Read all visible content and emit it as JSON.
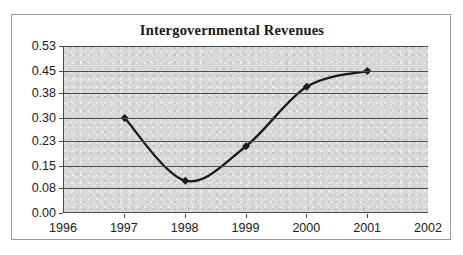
{
  "chart_data": {
    "type": "line",
    "title": "Intergovernmental Revenues",
    "xlabel": "",
    "ylabel": "",
    "x": [
      1996,
      1997,
      1998,
      1999,
      2000,
      2001,
      2002
    ],
    "xtick_labels": [
      "1996",
      "1997",
      "1998",
      "1999",
      "2000",
      "2001",
      "2002"
    ],
    "xlim": [
      1996,
      2002
    ],
    "ylim": [
      0.0,
      0.53
    ],
    "ytick_values": [
      0.0,
      0.08,
      0.15,
      0.23,
      0.3,
      0.38,
      0.45,
      0.53
    ],
    "ytick_labels": [
      "0.00",
      "0.08",
      "0.15",
      "0.23",
      "0.30",
      "0.38",
      "0.45",
      "0.53"
    ],
    "grid": "horizontal",
    "legend": "none",
    "smoothed": true,
    "marker": "diamond",
    "line_color": "#1a1a1a",
    "plot_background": "#d0d0d0",
    "series": [
      {
        "name": "Intergovernmental Revenues",
        "x": [
          1997,
          1998,
          1999,
          2000,
          2001
        ],
        "values": [
          0.3,
          0.1,
          0.21,
          0.4,
          0.45
        ]
      }
    ]
  }
}
